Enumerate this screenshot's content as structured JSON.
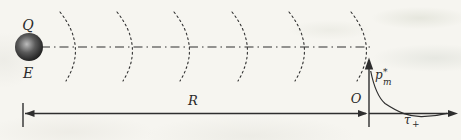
{
  "figure": {
    "labels": {
      "charge": "Q",
      "field": "E",
      "distance": "R",
      "origin": "O",
      "pulse": {
        "base": "p",
        "sup": "*",
        "sub": "m"
      },
      "time_constant": {
        "base": "τ",
        "sub": "+"
      }
    },
    "wavefronts": {
      "count": 6,
      "x_positions": [
        75,
        132,
        189,
        247,
        304,
        366
      ]
    },
    "colors": {
      "ink": "#2e2e2e",
      "paper": "#f6f5f0"
    }
  }
}
